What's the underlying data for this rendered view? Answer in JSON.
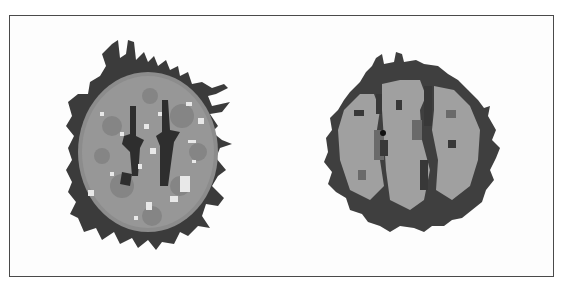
{
  "figure": {
    "panels": [
      {
        "id": "left",
        "description": "axial brain segmentation slice with spiky dark outer boundary, textured gray matter, dark central fissures and white lesion spots",
        "colors": {
          "outer_ring": "#3c3c3c",
          "tissue": "#8c8c8c",
          "tissue_light": "#a6a6a6",
          "fissure": "#2e2e2e",
          "spots": "#e6e6e6"
        }
      },
      {
        "id": "right",
        "description": "axial brain segmentation slice with dark outer boundary, light gray lobes and dark sulci/ventricles",
        "colors": {
          "outer_ring": "#404040",
          "tissue": "#9e9e9e",
          "tissue_dark": "#5a5a5a",
          "fissure": "#3a3a3a",
          "dot": "#111111"
        }
      }
    ],
    "frame_color": "#4a4a4a"
  }
}
